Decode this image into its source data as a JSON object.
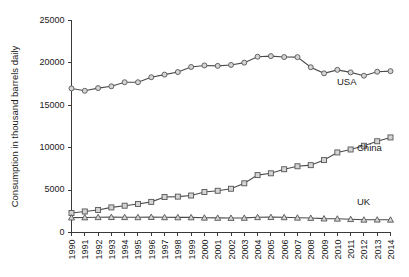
{
  "chart_data": {
    "type": "line",
    "title": "",
    "xlabel": "",
    "ylabel": "Consumption in thousand barrels daily",
    "ylim": [
      0,
      25000
    ],
    "yticks": [
      0,
      5000,
      10000,
      15000,
      20000,
      25000
    ],
    "ytick_labels": [
      "0",
      "5000",
      "10000",
      "15000",
      "20000",
      "25000"
    ],
    "grid": false,
    "legend_position": "inline-right-of-series",
    "categories": [
      "1990",
      "1991",
      "1992",
      "1993",
      "1994",
      "1995",
      "1996",
      "1997",
      "1998",
      "1999",
      "2000",
      "2001",
      "2002",
      "2003",
      "2004",
      "2005",
      "2006",
      "2007",
      "2008",
      "2009",
      "2010",
      "2011",
      "2012",
      "2013",
      "2014"
    ],
    "series": [
      {
        "name": "USA",
        "marker": "circle",
        "label": "USA",
        "values": [
          16990,
          16710,
          17030,
          17240,
          17720,
          17720,
          18310,
          18620,
          18920,
          19520,
          19700,
          19650,
          19760,
          20030,
          20730,
          20800,
          20690,
          20680,
          19490,
          18770,
          19180,
          18880,
          18490,
          18960,
          19030
        ]
      },
      {
        "name": "China",
        "marker": "square",
        "label": "China",
        "values": [
          2300,
          2480,
          2660,
          2960,
          3160,
          3360,
          3610,
          4180,
          4230,
          4360,
          4770,
          4920,
          5160,
          5800,
          6770,
          6980,
          7460,
          7810,
          7940,
          8540,
          9440,
          9790,
          10230,
          10760,
          11210
        ]
      },
      {
        "name": "UK",
        "marker": "triangle",
        "label": "UK",
        "values": [
          1760,
          1770,
          1800,
          1810,
          1800,
          1790,
          1820,
          1790,
          1780,
          1780,
          1740,
          1720,
          1710,
          1720,
          1800,
          1810,
          1790,
          1740,
          1710,
          1640,
          1620,
          1570,
          1500,
          1510,
          1500
        ]
      }
    ]
  },
  "series_labels": {
    "usa": "USA",
    "china": "China",
    "uk": "UK"
  }
}
